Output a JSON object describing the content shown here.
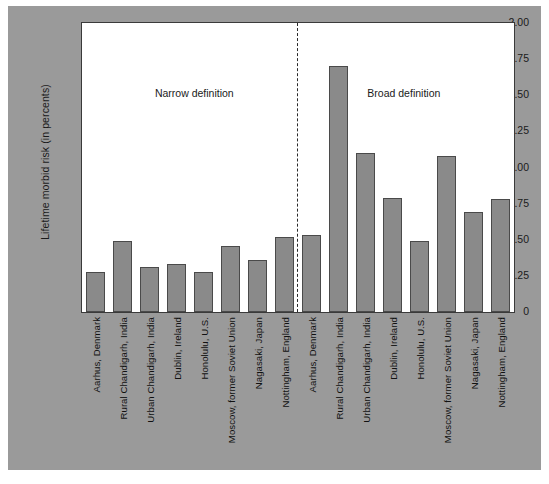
{
  "figure": {
    "background_color": "#9a9a9a",
    "plot_background_color": "#ffffff",
    "bar_fill_color": "#8a8a8a",
    "bar_edge_color": "#4a4a4a",
    "axis_color": "#2d2d2d"
  },
  "chart_data": {
    "type": "bar",
    "title": "",
    "xlabel": "",
    "ylabel": "Lifetime morbid risk (in percents)",
    "ylim": [
      0,
      2.0
    ],
    "yticks": [
      0,
      0.25,
      0.5,
      0.75,
      1.0,
      1.25,
      1.5,
      1.75,
      2.0
    ],
    "ytick_labels": [
      "0",
      ".25",
      ".50",
      ".75",
      "1.00",
      "1.25",
      "1.50",
      "1.75",
      "2.00"
    ],
    "grid": false,
    "legend": null,
    "annotations": [
      {
        "text": "Narrow definition",
        "x_fraction": 0.26,
        "y_value": 1.56
      },
      {
        "text": "Broad definition",
        "x_fraction": 0.745,
        "y_value": 1.56
      }
    ],
    "divider_line": {
      "style": "dashed",
      "x_fraction": 0.497
    },
    "categories": [
      "Aarhus, Denmark",
      "Rural Chandigarh, India",
      "Urban Chandigarh, India",
      "Dublin, Ireland",
      "Honolulu, U.S.",
      "Moscow, former Soviet Union",
      "Nagasaki, Japan",
      "Nottingham, England"
    ],
    "series": [
      {
        "name": "Narrow definition",
        "values": [
          0.28,
          0.49,
          0.31,
          0.33,
          0.28,
          0.46,
          0.36,
          0.52
        ]
      },
      {
        "name": "Broad definition",
        "values": [
          0.53,
          1.7,
          1.1,
          0.79,
          0.49,
          1.08,
          0.69,
          0.78
        ]
      }
    ],
    "bars": [
      {
        "label": "Aarhus, Denmark",
        "group": "Narrow definition",
        "value": 0.28
      },
      {
        "label": "Rural Chandigarh, India",
        "group": "Narrow definition",
        "value": 0.49
      },
      {
        "label": "Urban Chandigarh, India",
        "group": "Narrow definition",
        "value": 0.31
      },
      {
        "label": "Dublin, Ireland",
        "group": "Narrow definition",
        "value": 0.33
      },
      {
        "label": "Honolulu, U.S.",
        "group": "Narrow definition",
        "value": 0.28
      },
      {
        "label": "Moscow, former Soviet Union",
        "group": "Narrow definition",
        "value": 0.46
      },
      {
        "label": "Nagasaki, Japan",
        "group": "Narrow definition",
        "value": 0.36
      },
      {
        "label": "Nottingham, England",
        "group": "Narrow definition",
        "value": 0.52
      },
      {
        "label": "Aarhus, Denmark",
        "group": "Broad definition",
        "value": 0.53
      },
      {
        "label": "Rural Chandigarh, India",
        "group": "Broad definition",
        "value": 1.7
      },
      {
        "label": "Urban Chandigarh, India",
        "group": "Broad definition",
        "value": 1.1
      },
      {
        "label": "Dublin, Ireland",
        "group": "Broad definition",
        "value": 0.79
      },
      {
        "label": "Honolulu, U.S.",
        "group": "Broad definition",
        "value": 0.49
      },
      {
        "label": "Moscow, former Soviet Union",
        "group": "Broad definition",
        "value": 1.08
      },
      {
        "label": "Nagasaki, Japan",
        "group": "Broad definition",
        "value": 0.69
      },
      {
        "label": "Nottingham, England",
        "group": "Broad definition",
        "value": 0.78
      }
    ]
  }
}
